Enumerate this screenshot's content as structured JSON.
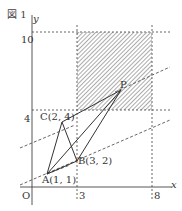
{
  "figure": {
    "title": "図 1",
    "axes": {
      "x_label": "x",
      "y_label": "y",
      "origin_label": "O"
    },
    "ticks": {
      "x": [
        "3",
        "8"
      ],
      "y": [
        "4",
        "10"
      ]
    },
    "points": [
      {
        "name": "A",
        "label": "A(1, 1)",
        "x": 1,
        "y": 1
      },
      {
        "name": "B",
        "label": "B(3, 2)",
        "x": 3,
        "y": 2
      },
      {
        "name": "C",
        "label": "C(2, 4)",
        "x": 2,
        "y": 4
      },
      {
        "name": "P",
        "label": "P"
      }
    ],
    "shaded_region": {
      "x_range": [
        3,
        8
      ],
      "y_range": [
        4,
        10
      ]
    },
    "colors": {
      "line": "#333333",
      "hatch": "#666666",
      "dashed": "#555555"
    }
  }
}
